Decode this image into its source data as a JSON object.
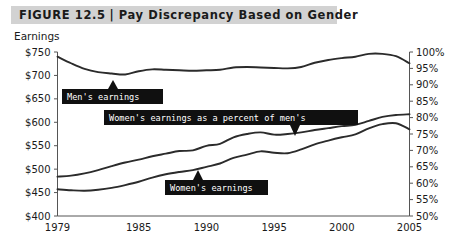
{
  "header": {
    "figure_label": "FIGURE 12.5",
    "separator": "|",
    "title": "Pay Discrepancy Based on Gender"
  },
  "chart_data": {
    "type": "line",
    "title": "Pay Discrepancy Based on Gender",
    "xlabel": "",
    "ylabel": "Earnings",
    "y2label": "",
    "grid": false,
    "legend": "annotations",
    "xlim": [
      1979,
      2005
    ],
    "ylim": [
      400,
      750
    ],
    "y2lim": [
      50,
      100
    ],
    "xticks": [
      1979,
      1985,
      1990,
      1995,
      2000,
      2005
    ],
    "xticklabels": [
      "1979",
      "1985",
      "1990",
      "1995",
      "2000",
      "2005"
    ],
    "yticks": [
      400,
      450,
      500,
      550,
      600,
      650,
      700,
      750
    ],
    "yticklabels": [
      "$400",
      "$450",
      "$500",
      "$550",
      "$600",
      "$650",
      "$700",
      "$750"
    ],
    "y2ticks": [
      50,
      55,
      60,
      65,
      70,
      75,
      80,
      85,
      90,
      95,
      100
    ],
    "y2ticklabels": [
      "50%",
      "55%",
      "60%",
      "65%",
      "70%",
      "75%",
      "80%",
      "85%",
      "90%",
      "95%",
      "100%"
    ],
    "x": [
      1979,
      1980,
      1981,
      1982,
      1983,
      1984,
      1985,
      1986,
      1987,
      1988,
      1989,
      1990,
      1991,
      1992,
      1993,
      1994,
      1995,
      1996,
      1997,
      1998,
      1999,
      2000,
      2001,
      2002,
      2003,
      2004,
      2005
    ],
    "series": [
      {
        "name": "Men's earnings",
        "axis": "left",
        "values": [
          740,
          726,
          714,
          707,
          704,
          702,
          709,
          713,
          712,
          711,
          710,
          711,
          712,
          717,
          718,
          717,
          716,
          715,
          718,
          727,
          733,
          737,
          740,
          746,
          746,
          741,
          726
        ]
      },
      {
        "name": "Women's earnings as a percent of men's",
        "axis": "right",
        "values": [
          62.0,
          62.3,
          63.0,
          64.0,
          65.2,
          66.3,
          67.2,
          68.2,
          69.0,
          69.8,
          70.0,
          71.4,
          72.0,
          74.0,
          75.0,
          75.5,
          74.8,
          75.0,
          75.5,
          76.2,
          76.8,
          77.4,
          77.8,
          79.0,
          80.2,
          80.8,
          81.0
        ]
      },
      {
        "name": "Women's earnings",
        "axis": "left",
        "values": [
          457,
          455,
          454,
          456,
          460,
          466,
          473,
          482,
          489,
          494,
          498,
          505,
          512,
          524,
          531,
          538,
          535,
          534,
          542,
          553,
          561,
          568,
          574,
          587,
          596,
          598,
          585
        ]
      }
    ],
    "annotations": [
      {
        "label": "Men's earnings",
        "points_to_series": "Men's earnings",
        "pointer": "up"
      },
      {
        "label": "Women's earnings as a percent of men's",
        "points_to_series": "Women's earnings as a percent of men's",
        "pointer": "down"
      },
      {
        "label": "Women's earnings",
        "points_to_series": "Women's earnings",
        "pointer": "up"
      }
    ]
  }
}
